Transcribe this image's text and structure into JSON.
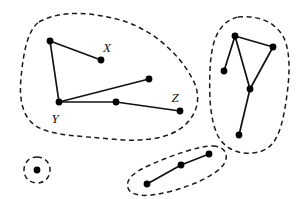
{
  "figure": {
    "background_color": "#ffffff",
    "stroke_color": "#111111",
    "dash_color": "#1a1a1a",
    "node_color": "#000000",
    "node_radius": 3.4,
    "width": 298,
    "height": 199
  },
  "labels": [
    {
      "id": "label-x",
      "text": "X",
      "x": 107,
      "y": 52
    },
    {
      "id": "label-y",
      "text": "Y",
      "x": 55,
      "y": 123
    },
    {
      "id": "label-z",
      "text": "Z",
      "x": 175,
      "y": 102
    }
  ],
  "components": [
    {
      "id": "component-main",
      "name": "large-component",
      "node_count": 6,
      "edge_count": 5,
      "outline": "M 39 22 C 60 10 92 12 120 20 C 150 28 178 52 192 78 C 202 96 198 112 186 124 C 170 140 140 142 112 139 C 80 136 52 136 36 126 C 22 117 19 98 21 78 C 23 56 27 30 39 22 Z"
    },
    {
      "id": "component-right",
      "name": "right-component",
      "node_count": 5,
      "edge_count": 5,
      "outline": "M 238 17 C 258 15 276 22 284 38 C 292 56 289 84 285 108 C 281 130 276 146 262 151 C 244 157 226 151 218 136 C 210 120 209 96 210 70 C 211 46 216 22 238 17 Z"
    },
    {
      "id": "component-bottom",
      "name": "bottom-component",
      "node_count": 3,
      "edge_count": 2,
      "outline": "M 213 146 C 224 146 229 154 225 162 C 220 173 197 184 172 191 C 150 197 134 197 129 190 C 124 182 131 173 150 165 C 172 155 199 146 213 146 Z"
    },
    {
      "id": "component-isolated",
      "name": "isolated-vertex-component",
      "node_count": 1,
      "edge_count": 0,
      "outline": "M 37 157 C 45 157 50 163 50 170 C 50 177 45 183 37 183 C 29 183 24 177 24 170 C 24 163 29 157 37 157 Z"
    }
  ],
  "nodes": [
    {
      "id": "n1",
      "name": "vertex-top-left",
      "x": 50,
      "y": 41,
      "component": "component-main"
    },
    {
      "id": "n2",
      "name": "vertex-x",
      "x": 101,
      "y": 60,
      "component": "component-main"
    },
    {
      "id": "n3",
      "name": "vertex-y",
      "x": 59,
      "y": 102,
      "component": "component-main"
    },
    {
      "id": "n4",
      "name": "vertex-upper-right",
      "x": 149,
      "y": 79,
      "component": "component-main"
    },
    {
      "id": "n5",
      "name": "vertex-middle",
      "x": 116,
      "y": 102,
      "component": "component-main"
    },
    {
      "id": "n6",
      "name": "vertex-z",
      "x": 180,
      "y": 111,
      "component": "component-main"
    },
    {
      "id": "n7",
      "name": "vertex-right-top",
      "x": 235,
      "y": 36,
      "component": "component-right"
    },
    {
      "id": "n8",
      "name": "vertex-right-upper-right",
      "x": 273,
      "y": 47,
      "component": "component-right"
    },
    {
      "id": "n9",
      "name": "vertex-right-left",
      "x": 224,
      "y": 71,
      "component": "component-right"
    },
    {
      "id": "n10",
      "name": "vertex-right-center",
      "x": 250,
      "y": 89,
      "component": "component-right"
    },
    {
      "id": "n11",
      "name": "vertex-right-bottom",
      "x": 239,
      "y": 135,
      "component": "component-right"
    },
    {
      "id": "n12",
      "name": "vertex-bottom-left",
      "x": 147,
      "y": 184,
      "component": "component-bottom"
    },
    {
      "id": "n13",
      "name": "vertex-bottom-middle",
      "x": 181,
      "y": 165,
      "component": "component-bottom"
    },
    {
      "id": "n14",
      "name": "vertex-bottom-right",
      "x": 209,
      "y": 154,
      "component": "component-bottom"
    },
    {
      "id": "n15",
      "name": "vertex-isolated",
      "x": 37,
      "y": 170,
      "component": "component-isolated"
    }
  ],
  "edges": [
    {
      "id": "e1",
      "name": "edge-topleft-x",
      "x1": 50,
      "y1": 41,
      "x2": 101,
      "y2": 60
    },
    {
      "id": "e2",
      "name": "edge-topleft-y",
      "x1": 50,
      "y1": 41,
      "x2": 59,
      "y2": 102
    },
    {
      "id": "e3",
      "name": "edge-y-upperright",
      "x1": 59,
      "y1": 102,
      "x2": 149,
      "y2": 79
    },
    {
      "id": "e4",
      "name": "edge-y-middle",
      "x1": 59,
      "y1": 102,
      "x2": 116,
      "y2": 102
    },
    {
      "id": "e5",
      "name": "edge-middle-z",
      "x1": 116,
      "y1": 102,
      "x2": 180,
      "y2": 111
    },
    {
      "id": "e6",
      "name": "edge-righttop-upperright",
      "x1": 235,
      "y1": 36,
      "x2": 273,
      "y2": 47
    },
    {
      "id": "e7",
      "name": "edge-righttop-rightleft",
      "x1": 235,
      "y1": 36,
      "x2": 224,
      "y2": 71
    },
    {
      "id": "e8",
      "name": "edge-righttop-rightcenter",
      "x1": 235,
      "y1": 36,
      "x2": 250,
      "y2": 89
    },
    {
      "id": "e9",
      "name": "edge-upperright-rightcenter",
      "x1": 273,
      "y1": 47,
      "x2": 250,
      "y2": 89
    },
    {
      "id": "e10",
      "name": "edge-rightcenter-rightbottom",
      "x1": 250,
      "y1": 89,
      "x2": 239,
      "y2": 135
    },
    {
      "id": "e11",
      "name": "edge-bottomleft-bottommiddle",
      "x1": 147,
      "y1": 184,
      "x2": 181,
      "y2": 165
    },
    {
      "id": "e12",
      "name": "edge-bottommiddle-bottomright",
      "x1": 181,
      "y1": 165,
      "x2": 209,
      "y2": 154
    }
  ]
}
